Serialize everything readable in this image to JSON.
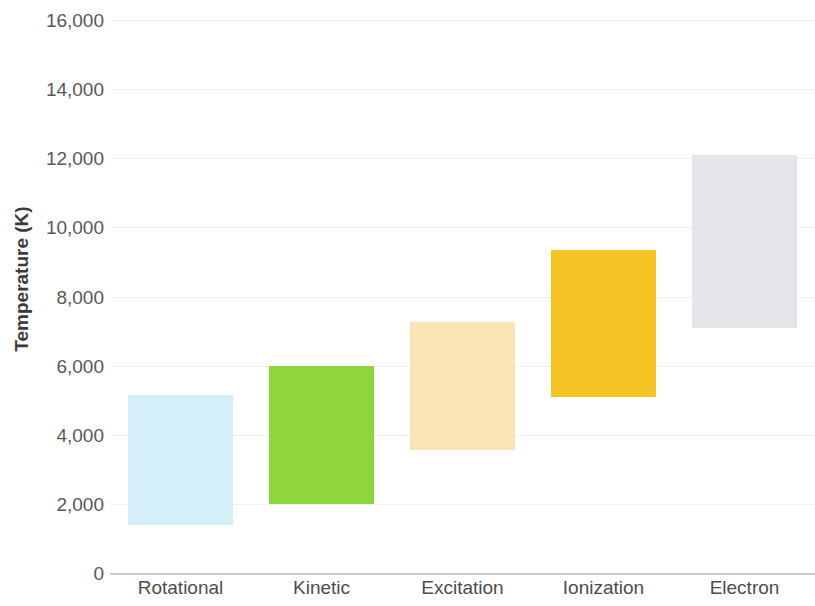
{
  "chart_data": {
    "type": "bar",
    "subtype": "floating-range-bar",
    "title": "",
    "subtitle": "",
    "xlabel": "",
    "ylabel": "Temperature (K)",
    "categories": [
      "Rotational",
      "Kinetic",
      "Excitation",
      "Ionization",
      "Electron"
    ],
    "series": [
      {
        "name": "Temperature range",
        "low": [
          1400,
          2000,
          3550,
          5100,
          7100
        ],
        "high": [
          5150,
          6000,
          7250,
          9350,
          12100
        ]
      }
    ],
    "bars": [
      {
        "category": "Rotational",
        "low": 1400,
        "high": 5150,
        "color": "#d5eff8"
      },
      {
        "category": "Kinetic",
        "low": 2000,
        "high": 6000,
        "color": "#8ed639"
      },
      {
        "category": "Excitation",
        "low": 3550,
        "high": 7250,
        "color": "#fae3b5"
      },
      {
        "category": "Ionization",
        "low": 5100,
        "high": 9350,
        "color": "#f6c425"
      },
      {
        "category": "Electron",
        "low": 7100,
        "high": 12100,
        "color": "#e4e6ea"
      }
    ],
    "ylim": [
      0,
      16000
    ],
    "ytick_values": [
      0,
      2000,
      4000,
      6000,
      8000,
      10000,
      12000,
      14000,
      16000
    ],
    "ytick_labels": [
      "0",
      "2,000",
      "4,000",
      "6,000",
      "8,000",
      "10,000",
      "12,000",
      "14,000",
      "16,000"
    ],
    "grid": true,
    "grid_color": "#f0f0f2",
    "axis_color": "#c9c9cb",
    "legend": false,
    "legend_position": "none",
    "background": "#ffffff",
    "tick_label_color": "#58585a",
    "axis_title_color": "#3b3b3b"
  }
}
